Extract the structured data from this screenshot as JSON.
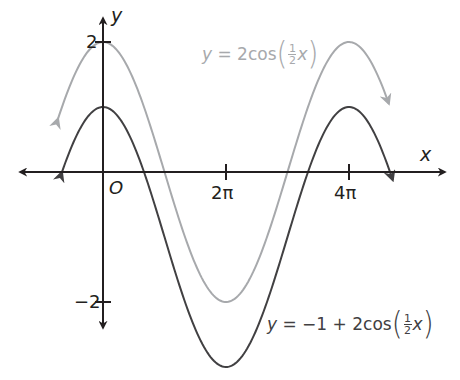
{
  "chart_data": {
    "type": "line",
    "title": "",
    "xlabel": "x",
    "ylabel": "y",
    "origin_label": "O",
    "x_ticks": [
      {
        "value": 6.2832,
        "label": "2π"
      },
      {
        "value": 12.5664,
        "label": "4π"
      }
    ],
    "y_ticks": [
      {
        "value": 2,
        "label": "2"
      },
      {
        "value": -2,
        "label": "−2"
      }
    ],
    "xlim": [
      -3.0,
      14.5
    ],
    "ylim": [
      -3.2,
      2.4
    ],
    "grid": false,
    "series": [
      {
        "name": "y = 2cos(½x)",
        "expression": "2*cos(x/2)",
        "color": "#a7a9ac",
        "x_range": [
          -2.3,
          14.6
        ],
        "key_points": [
          {
            "x": 0,
            "y": 2
          },
          {
            "x": 3.1416,
            "y": 0
          },
          {
            "x": 6.2832,
            "y": -2
          },
          {
            "x": 9.4248,
            "y": 0
          },
          {
            "x": 12.5664,
            "y": 2
          }
        ]
      },
      {
        "name": "y = −1 + 2cos(½x)",
        "expression": "-1+2*cos(x/2)",
        "color": "#414042",
        "x_range": [
          -2.1,
          14.8
        ],
        "key_points": [
          {
            "x": 0,
            "y": 1
          },
          {
            "x": 2.0944,
            "y": 0
          },
          {
            "x": 6.2832,
            "y": -3
          },
          {
            "x": 10.472,
            "y": 0
          },
          {
            "x": 12.5664,
            "y": 1
          }
        ]
      }
    ],
    "annotations": [
      {
        "text": "y = 2cos(½x)",
        "attached_to": "y = 2cos(½x)"
      },
      {
        "text": "y = −1 + 2cos(½x)",
        "attached_to": "y = −1 + 2cos(½x)"
      }
    ]
  },
  "labels": {
    "x_axis": "x",
    "y_axis": "y",
    "origin": "O",
    "tick_2pi": "2π",
    "tick_4pi": "4π",
    "tick_y2": "2",
    "tick_yneg2": "−2",
    "eq1": {
      "lhs": "y",
      "eq": " = 2cos",
      "num": "1",
      "den": "2",
      "var": "x"
    },
    "eq2": {
      "lhs": "y",
      "eq": " = −1 + 2cos",
      "num": "1",
      "den": "2",
      "var": "x"
    }
  }
}
